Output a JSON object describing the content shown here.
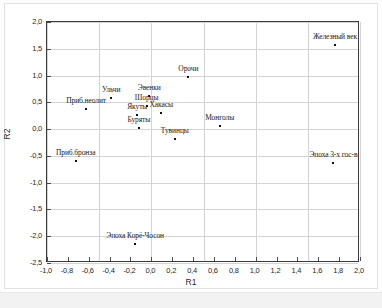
{
  "chart_data": {
    "type": "scatter",
    "title": "",
    "xlabel": "R1",
    "ylabel": "R2",
    "xlim": [
      -1.0,
      2.0
    ],
    "ylim": [
      -2.5,
      2.0
    ],
    "xticks": [
      "-1,0",
      "-0,8",
      "-0,6",
      "-0,4",
      "-0,2",
      "0,0",
      "0,2",
      "0,4",
      "0,6",
      "0,8",
      "1,0",
      "1,2",
      "1,4",
      "1,6",
      "1,8",
      "2,0"
    ],
    "xtick_values": [
      -1.0,
      -0.8,
      -0.6,
      -0.4,
      -0.2,
      0.0,
      0.2,
      0.4,
      0.6,
      0.8,
      1.0,
      1.2,
      1.4,
      1.6,
      1.8,
      2.0
    ],
    "yticks": [
      "2,0",
      "1,5",
      "1,0",
      "0,5",
      "0,0",
      "-0,5",
      "-1,0",
      "-1,5",
      "-2,0",
      "-2,5"
    ],
    "ytick_values": [
      2.0,
      1.5,
      1.0,
      0.5,
      0.0,
      -0.5,
      -1.0,
      -1.5,
      -2.0,
      -2.5
    ],
    "grid": true,
    "grid_x_values": [
      -1.0,
      -0.5,
      0.0,
      0.5,
      1.0,
      1.5,
      2.0
    ],
    "grid_y_values": [
      2.0,
      1.5,
      1.0,
      0.5,
      0.0,
      -0.5,
      -1.0,
      -1.5,
      -2.0,
      -2.5
    ],
    "legend": null,
    "marker_color": "#111111",
    "points": [
      {
        "label": "Железный век",
        "x": 1.76,
        "y": 1.57,
        "label_dx": 0,
        "label_dy": -4
      },
      {
        "label": "Орочи",
        "x": 0.355,
        "y": 0.97,
        "label_dx": 0,
        "label_dy": -4
      },
      {
        "label": "Ульчи",
        "x": -0.385,
        "y": 0.59,
        "label_dx": 0,
        "label_dy": -4
      },
      {
        "label": "Эвенки",
        "x": -0.02,
        "y": 0.62,
        "label_dx": 0,
        "label_dy": -4
      },
      {
        "label": "Шорцы",
        "x": -0.045,
        "y": 0.44,
        "label_dx": 0,
        "label_dy": -4
      },
      {
        "label": "Приб.неолит",
        "x": -0.625,
        "y": 0.38,
        "label_dx": 0,
        "label_dy": -4
      },
      {
        "label": "Хакасы",
        "x": 0.095,
        "y": 0.31,
        "label_dx": 0,
        "label_dy": -4
      },
      {
        "label": "Якуты",
        "x": -0.135,
        "y": 0.26,
        "label_dx": 0,
        "label_dy": -4
      },
      {
        "label": "Буряты",
        "x": -0.12,
        "y": 0.03,
        "label_dx": 0,
        "label_dy": -4
      },
      {
        "label": "Монголы",
        "x": 0.655,
        "y": 0.05,
        "label_dx": 0,
        "label_dy": -4
      },
      {
        "label": "Тувинцы",
        "x": 0.225,
        "y": -0.19,
        "label_dx": 0,
        "label_dy": -4
      },
      {
        "label": "Приб.бронза",
        "x": -0.725,
        "y": -0.59,
        "label_dx": 0,
        "label_dy": -4
      },
      {
        "label": "Эпоха 3-х гос-в",
        "x": 1.745,
        "y": -0.64,
        "label_dx": 0,
        "label_dy": -4
      },
      {
        "label": "Эпоха Корё-Чосон",
        "x": -0.155,
        "y": -2.15,
        "label_dx": 0,
        "label_dy": -4
      }
    ]
  }
}
